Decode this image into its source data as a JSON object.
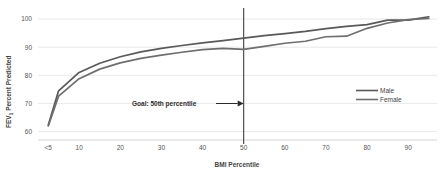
{
  "chart_data": {
    "type": "line",
    "title": "",
    "xlabel": "BMI Percentile",
    "ylabel_main": "FEV",
    "ylabel_sub": "1",
    "ylabel_rest": " Percent Predicted",
    "ylabel_full": "FEV1 Percent Predicted",
    "x": [
      2.5,
      5,
      10,
      15,
      20,
      25,
      30,
      35,
      40,
      45,
      50,
      55,
      60,
      65,
      70,
      75,
      80,
      85,
      90,
      95
    ],
    "xtick_labels": [
      "<5",
      "10",
      "20",
      "30",
      "40",
      "50",
      "60",
      "70",
      "80",
      "90"
    ],
    "xtick_values": [
      2.5,
      10,
      20,
      30,
      40,
      50,
      60,
      70,
      80,
      90
    ],
    "ytick_labels": [
      "60",
      "70",
      "80",
      "90",
      "100"
    ],
    "ytick_values": [
      60,
      70,
      80,
      90,
      100
    ],
    "xlim": [
      0,
      97
    ],
    "ylim": [
      57,
      102.5
    ],
    "grid": "horizontal",
    "legend_position": "right-upper",
    "series": [
      {
        "name": "Male",
        "color": "#595959",
        "values": [
          62.3,
          74.5,
          81.0,
          84.3,
          86.6,
          88.3,
          89.6,
          90.6,
          91.5,
          92.3,
          93.2,
          94.1,
          94.8,
          95.6,
          96.6,
          97.4,
          98.0,
          99.6,
          99.6,
          100.8
        ]
      },
      {
        "name": "Female",
        "color": "#6e6e6e",
        "values": [
          62.0,
          72.6,
          78.8,
          82.2,
          84.4,
          86.0,
          87.2,
          88.2,
          89.1,
          89.6,
          89.2,
          90.3,
          91.4,
          92.1,
          93.7,
          93.9,
          96.7,
          98.6,
          99.8,
          100.2
        ]
      }
    ],
    "annotations": [
      {
        "text": "Goal: 50th percentile",
        "arrow": "right-arrow",
        "target_x": 50
      }
    ],
    "reference_line": {
      "name": "goal-line",
      "x": 50,
      "color": "#3f3f3f"
    }
  },
  "legend": {
    "items": [
      {
        "label": "Male"
      },
      {
        "label": "Female"
      }
    ]
  },
  "colors": {
    "male_line": "#595959",
    "female_line": "#6e6e6e",
    "grid": "#e3e3e3",
    "axis": "#c9c9c9",
    "text": "#3f3f3f",
    "background": "#ffffff"
  }
}
